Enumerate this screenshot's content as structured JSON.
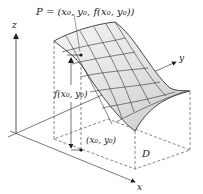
{
  "figure": {
    "point_label": "P = (x₀, y₀, f(x₀, y₀))",
    "height_label": "f(x₀, y₀)",
    "base_point_label": "(x₀, y₀)",
    "domain_label": "D",
    "axes": {
      "x": "x",
      "y": "y",
      "z": "z"
    }
  },
  "colors": {
    "surface_light": "#f2f2f2",
    "surface_dark": "#c8c8c8",
    "lines": "#333333",
    "axes": "#444444"
  }
}
